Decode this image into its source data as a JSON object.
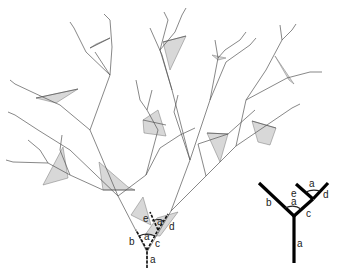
{
  "figure": {
    "type": "fractal-tree-branching-diagram",
    "tree_labels": {
      "trunk": "a",
      "left_branch": "b",
      "right_branch": "c",
      "angle_lower": "a",
      "angle_upper": "a",
      "sub_left": "e",
      "sub_right": "d"
    },
    "schematic_labels": {
      "trunk": "a",
      "left_branch": "b",
      "right_branch": "c",
      "angle_lower": "a",
      "sub_left": "e",
      "angle_upper": "a",
      "sub_right": "d"
    },
    "colors": {
      "line": "#555555",
      "shade": "#d8d8d8",
      "schematic": "#000000"
    }
  }
}
